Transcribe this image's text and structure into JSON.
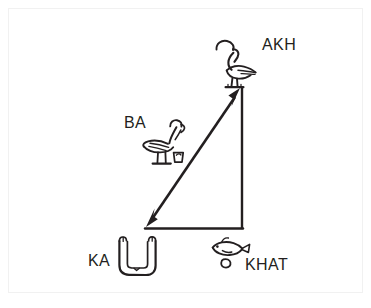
{
  "figure": {
    "kind": "diagram",
    "background_color": "#ffffff",
    "ink_color": "#231f20",
    "frame_color": "#f1f1f1"
  },
  "nodes": [
    {
      "id": "akh",
      "label": "AKH",
      "glyph_name": "crested-ibis-hieroglyph",
      "glyph_description": "crested ibis bird standing on a base line",
      "position": "top-right vertex",
      "x": 240,
      "y": 88
    },
    {
      "id": "ba",
      "label": "BA",
      "glyph_name": "ba-bird-hieroglyph",
      "glyph_description": "human-headed ba bird with brazier",
      "position": "midpoint of hypotenuse",
      "x": 170,
      "y": 150
    },
    {
      "id": "ka",
      "label": "KA",
      "glyph_name": "upraised-arms-hieroglyph",
      "glyph_description": "pair of upraised arms forming a U shape",
      "position": "bottom-left vertex",
      "x": 145,
      "y": 228
    },
    {
      "id": "khat",
      "label": "KHAT",
      "glyph_name": "fish-and-loaf-hieroglyph",
      "glyph_description": "fish glyph above a small rounded loaf sign",
      "position": "bottom-right vertex",
      "x": 243,
      "y": 228
    }
  ],
  "edges": [
    {
      "id": "hypotenuse",
      "name": "ka-akh-double-arrow",
      "from": "ka",
      "to": "akh",
      "style": "double-headed arrow",
      "arrowheads": [
        "start",
        "end"
      ]
    },
    {
      "id": "vertical-leg",
      "name": "akh-khat-line",
      "from": "akh",
      "to": "khat",
      "style": "plain line",
      "arrowheads": []
    },
    {
      "id": "horizontal-leg",
      "name": "ka-khat-line",
      "from": "ka",
      "to": "khat",
      "style": "plain line",
      "arrowheads": []
    }
  ]
}
